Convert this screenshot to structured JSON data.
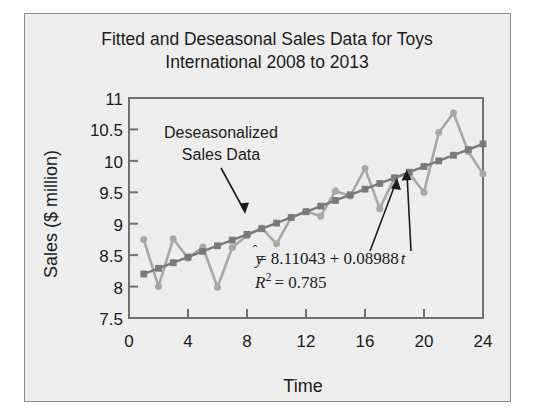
{
  "figure": {
    "background_color": "#eeeeee",
    "border_color": "#8e8e8e"
  },
  "chart_data": {
    "type": "line",
    "title": "Fitted and Deseasonal Sales Data for Toys International 2008 to 2013",
    "title_line1": "Fitted and Deseasonal Sales Data for Toys",
    "title_line2": "International 2008 to 2013",
    "xlabel": "Time",
    "ylabel": "Sales ($ million)",
    "xlim": [
      0,
      24
    ],
    "ylim": [
      7.5,
      11
    ],
    "xticks": [
      0,
      4,
      8,
      12,
      16,
      20,
      24
    ],
    "xtick_labels": [
      "0",
      "4",
      "8",
      "12",
      "16",
      "20",
      "24"
    ],
    "yticks": [
      7.5,
      8,
      8.5,
      9,
      9.5,
      10,
      10.5,
      11
    ],
    "ytick_labels": [
      "7.5",
      "8",
      "8.5",
      "9",
      "9.5",
      "10",
      "10.5",
      "11"
    ],
    "grid": false,
    "legend": "none",
    "x": [
      1,
      2,
      3,
      4,
      5,
      6,
      7,
      8,
      9,
      10,
      11,
      12,
      13,
      14,
      15,
      16,
      17,
      18,
      19,
      20,
      21,
      22,
      23,
      24
    ],
    "series": [
      {
        "name": "Deseasonalized Sales Data",
        "marker": "circle",
        "color": "#a8a8a8",
        "values": [
          8.75,
          8.0,
          8.76,
          8.45,
          8.63,
          7.99,
          8.62,
          8.81,
          8.93,
          8.68,
          9.1,
          9.2,
          9.12,
          9.52,
          9.44,
          9.88,
          9.24,
          9.73,
          9.8,
          9.5,
          10.45,
          10.76,
          10.15,
          9.79
        ]
      },
      {
        "name": "Fitted Trend",
        "marker": "square",
        "color": "#7a7a7a",
        "values": [
          8.2,
          8.29,
          8.38,
          8.47,
          8.56,
          8.65,
          8.74,
          8.83,
          8.92,
          9.01,
          9.1,
          9.19,
          9.28,
          9.37,
          9.46,
          9.55,
          9.64,
          9.73,
          9.82,
          9.91,
          10.0,
          10.09,
          10.18,
          10.27
        ]
      }
    ],
    "annotations": [
      {
        "name": "deseasonalized-label",
        "text_line1": "Deseasonalized",
        "text_line2": "Sales Data"
      },
      {
        "name": "regression-equation",
        "yhat_symbol": "y",
        "equation": "= 8.11043 + 0.08988",
        "equation_var": "t",
        "r_symbol": "R",
        "r_exponent": "2",
        "r_value": "= 0.785"
      }
    ]
  }
}
